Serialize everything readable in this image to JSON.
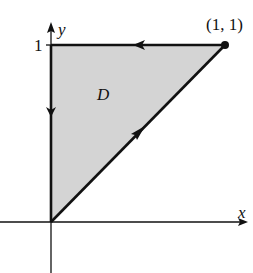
{
  "diagram": {
    "type": "region-with-oriented-boundary",
    "axes": {
      "x_label": "x",
      "y_label": "y",
      "y_tick_label": "1"
    },
    "region": {
      "label": "D",
      "fill_color": "#d4d4d4",
      "vertices": [
        [
          0,
          0
        ],
        [
          1,
          1
        ],
        [
          0,
          1
        ]
      ]
    },
    "point_label": "(1, 1)",
    "boundary": [
      {
        "from": [
          0,
          0
        ],
        "to": [
          1,
          1
        ],
        "direction": "up-right"
      },
      {
        "from": [
          1,
          1
        ],
        "to": [
          0,
          1
        ],
        "direction": "left"
      },
      {
        "from": [
          0,
          1
        ],
        "to": [
          0,
          0
        ],
        "direction": "down"
      }
    ],
    "colors": {
      "stroke": "#111111",
      "region_fill": "#d4d4d4",
      "background": "#ffffff"
    }
  }
}
